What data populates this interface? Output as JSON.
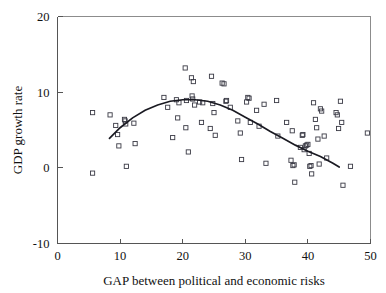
{
  "chart_data": {
    "type": "scatter",
    "title": "",
    "xlabel": "GAP between political and economic risks",
    "ylabel": "GDP growth rate",
    "xlim": [
      0,
      50
    ],
    "ylim": [
      -10,
      20
    ],
    "xticks": [
      0,
      10,
      20,
      30,
      40,
      50
    ],
    "yticks": [
      -10,
      0,
      10,
      20
    ],
    "xtick_labels": [
      "0",
      "10",
      "20",
      "30",
      "40",
      "50"
    ],
    "ytick_labels": [
      "-10",
      "0",
      "10",
      "20"
    ],
    "grid": false,
    "legend": null,
    "marker": "open-square",
    "marker_color": "#3a3a45",
    "curve_color": "#1a1a22",
    "points": [
      [
        5.6,
        7.3
      ],
      [
        5.6,
        -0.7
      ],
      [
        8.4,
        7.0
      ],
      [
        9.3,
        5.6
      ],
      [
        9.6,
        4.4
      ],
      [
        9.8,
        2.9
      ],
      [
        10.7,
        6.4
      ],
      [
        10.8,
        6.2
      ],
      [
        10.9,
        5.8
      ],
      [
        11.0,
        0.2
      ],
      [
        12.2,
        5.9
      ],
      [
        12.4,
        3.2
      ],
      [
        17.0,
        9.3
      ],
      [
        17.6,
        8.0
      ],
      [
        18.4,
        4.0
      ],
      [
        19.0,
        9.0
      ],
      [
        19.2,
        6.6
      ],
      [
        19.4,
        8.6
      ],
      [
        20.4,
        13.2
      ],
      [
        20.5,
        5.3
      ],
      [
        20.6,
        8.9
      ],
      [
        20.9,
        2.1
      ],
      [
        21.4,
        11.9
      ],
      [
        21.5,
        9.5
      ],
      [
        21.6,
        9.1
      ],
      [
        21.7,
        11.4
      ],
      [
        21.9,
        8.3
      ],
      [
        22.7,
        8.7
      ],
      [
        23.0,
        6.0
      ],
      [
        23.2,
        8.6
      ],
      [
        24.4,
        5.2
      ],
      [
        24.6,
        12.1
      ],
      [
        24.8,
        8.5
      ],
      [
        25.0,
        7.3
      ],
      [
        25.2,
        4.3
      ],
      [
        26.3,
        11.2
      ],
      [
        26.6,
        11.1
      ],
      [
        26.9,
        8.8
      ],
      [
        27.0,
        8.9
      ],
      [
        27.6,
        8.0
      ],
      [
        28.8,
        6.2
      ],
      [
        29.2,
        4.6
      ],
      [
        29.4,
        1.1
      ],
      [
        30.2,
        8.7
      ],
      [
        30.4,
        9.3
      ],
      [
        30.6,
        9.2
      ],
      [
        30.8,
        6.0
      ],
      [
        31.8,
        7.6
      ],
      [
        32.2,
        5.5
      ],
      [
        33.0,
        8.4
      ],
      [
        33.3,
        0.6
      ],
      [
        35.0,
        8.9
      ],
      [
        35.2,
        4.2
      ],
      [
        36.6,
        6.0
      ],
      [
        37.3,
        1.0
      ],
      [
        37.5,
        4.9
      ],
      [
        37.6,
        0.3
      ],
      [
        37.8,
        0.4
      ],
      [
        37.9,
        -1.9
      ],
      [
        38.8,
        2.7
      ],
      [
        39.1,
        4.3
      ],
      [
        39.2,
        4.4
      ],
      [
        39.4,
        2.4
      ],
      [
        39.6,
        2.9
      ],
      [
        39.8,
        3.0
      ],
      [
        40.0,
        3.1
      ],
      [
        40.2,
        1.9
      ],
      [
        40.3,
        0.2
      ],
      [
        40.5,
        0.3
      ],
      [
        40.6,
        -0.8
      ],
      [
        40.9,
        8.6
      ],
      [
        41.2,
        6.4
      ],
      [
        41.4,
        5.3
      ],
      [
        41.6,
        3.8
      ],
      [
        41.8,
        0.5
      ],
      [
        42.0,
        7.8
      ],
      [
        42.2,
        7.5
      ],
      [
        42.6,
        4.2
      ],
      [
        43.0,
        1.3
      ],
      [
        44.5,
        7.3
      ],
      [
        44.7,
        7.0
      ],
      [
        44.9,
        5.2
      ],
      [
        45.2,
        8.8
      ],
      [
        45.4,
        6.0
      ],
      [
        45.6,
        -2.3
      ],
      [
        46.8,
        0.2
      ],
      [
        49.5,
        4.6
      ]
    ],
    "fit_curve": {
      "label": "quadratic fit",
      "x_start": 8.3,
      "x_end": 45.0,
      "points": [
        [
          8.3,
          3.9
        ],
        [
          10.0,
          5.3
        ],
        [
          12.0,
          6.6
        ],
        [
          14.0,
          7.6
        ],
        [
          16.0,
          8.3
        ],
        [
          18.0,
          8.8
        ],
        [
          20.0,
          9.0
        ],
        [
          22.0,
          9.0
        ],
        [
          24.0,
          8.8
        ],
        [
          26.0,
          8.3
        ],
        [
          28.0,
          7.6
        ],
        [
          30.0,
          6.7
        ],
        [
          32.0,
          5.8
        ],
        [
          34.0,
          4.8
        ],
        [
          36.0,
          3.9
        ],
        [
          38.0,
          3.0
        ],
        [
          40.0,
          2.2
        ],
        [
          42.0,
          1.5
        ],
        [
          44.0,
          0.6
        ],
        [
          45.0,
          0.1
        ]
      ]
    }
  },
  "axes": {
    "x_title": "GAP between political and economic risks",
    "y_title": "GDP growth rate"
  }
}
